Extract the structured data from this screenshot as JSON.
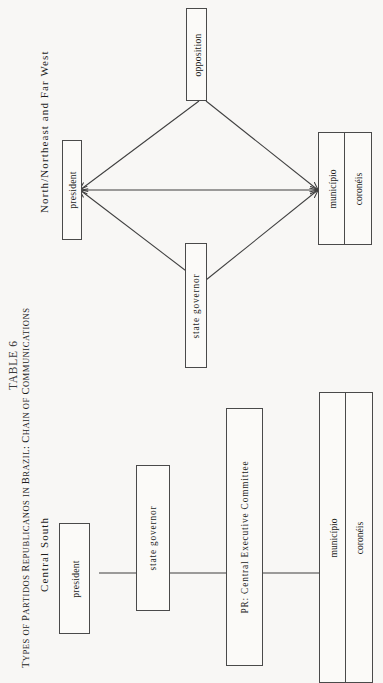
{
  "caption": {
    "table_number": "TABLE 6",
    "title_main": "TYPES OF PARTIDOS REPUBLICANOS IN BRAZIL: CHAIN OF COMMUNICATIONS",
    "title_segments": {
      "s1": "T",
      "s2": "YPES OF ",
      "s3": "P",
      "s4": "ARTIDOS ",
      "s5": "R",
      "s6": "EPUBLICANOS IN ",
      "s7": "B",
      "s8": "RAZIL",
      "s9": ": C",
      "s10": "HAIN OF ",
      "s11": "C",
      "s12": "OMMUNICATIONS"
    }
  },
  "sections": [
    {
      "id": "north-northeast-far-west",
      "label": "North/Northeast  and  Far  West",
      "layout": "diamond",
      "nodes": [
        {
          "id": "president",
          "label": "president"
        },
        {
          "id": "opposition",
          "label": "opposition"
        },
        {
          "id": "state-governor",
          "label": "state  governor"
        },
        {
          "id": "municipio",
          "label": "município"
        },
        {
          "id": "coroneis",
          "label": "coronéis"
        }
      ],
      "edges": [
        {
          "from": "president",
          "to": "opposition",
          "arrows": "both"
        },
        {
          "from": "opposition",
          "to": "municipio",
          "arrows": "both"
        },
        {
          "from": "president",
          "to": "municipio",
          "arrows": "both"
        },
        {
          "from": "president",
          "to": "state-governor",
          "arrows": "both"
        },
        {
          "from": "state-governor",
          "to": "municipio",
          "arrows": "both"
        }
      ]
    },
    {
      "id": "central-south",
      "label": "Central  South",
      "layout": "chain",
      "nodes": [
        {
          "id": "president",
          "label": "president"
        },
        {
          "id": "state-governor",
          "label": "state  governor"
        },
        {
          "id": "pr-committee",
          "label": "PR: Central  Executive  Committee"
        },
        {
          "id": "municipio",
          "label": "município"
        },
        {
          "id": "coroneis",
          "label": "coronéis"
        }
      ],
      "edges": [
        {
          "from": "president",
          "to": "state-governor",
          "arrows": "none"
        },
        {
          "from": "state-governor",
          "to": "pr-committee",
          "arrows": "none"
        },
        {
          "from": "pr-committee",
          "to": "municipio",
          "arrows": "none"
        }
      ]
    }
  ],
  "colors": {
    "page_background": "#f8f7f5",
    "box_stroke": "#4a4a4a",
    "box_fill": "#fbfaf8",
    "text": "#1a1a1a",
    "connector": "#3f3f3f"
  }
}
